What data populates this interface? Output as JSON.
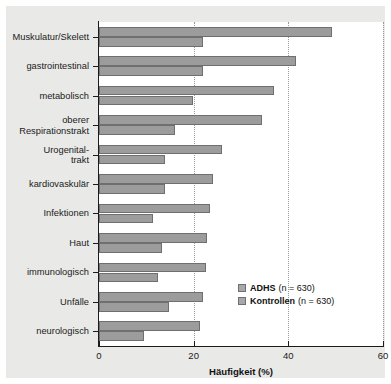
{
  "figure": {
    "panel_background": "#e9e9e7",
    "plot_background": "#ffffff",
    "bar_fill": "#9c9c9c",
    "bar_edge": "#6f6f6f"
  },
  "chart_data": {
    "type": "bar",
    "orientation": "horizontal",
    "title": "",
    "xlabel": "Häufigkeit (%)",
    "ylabel": "",
    "xlim": [
      0,
      60
    ],
    "xticks": [
      0,
      20,
      40,
      60
    ],
    "xtick_labels": [
      "0",
      "20",
      "40",
      "60"
    ],
    "grid": "vertical dotted at x ticks",
    "legend_position": "inner lower right",
    "categories": [
      "Muskulatur/Skelett",
      "gastrointestinal",
      "metabolisch",
      "oberer\nRespirationstrakt",
      "Urogenital-\ntrakt",
      "kardiovaskulär",
      "Infektionen",
      "Haut",
      "immunologisch",
      "Unfälle",
      "neurologisch"
    ],
    "series": [
      {
        "name": "ADHS",
        "n_label": "(n = 630)",
        "color": "#9c9c9c",
        "values": [
          49.3,
          41.6,
          37.0,
          34.5,
          26.0,
          24.0,
          23.5,
          22.8,
          22.6,
          22.0,
          21.4
        ]
      },
      {
        "name": "Kontrollen",
        "n_label": "(n = 630)",
        "color": "#9c9c9c",
        "values": [
          22.0,
          22.0,
          19.9,
          16.0,
          14.0,
          14.0,
          11.4,
          13.3,
          12.5,
          14.8,
          9.5
        ]
      }
    ]
  },
  "legend": {
    "items": [
      {
        "label": "ADHS",
        "n": "(n = 630)"
      },
      {
        "label": "Kontrollen",
        "n": "(n = 630)"
      }
    ]
  }
}
